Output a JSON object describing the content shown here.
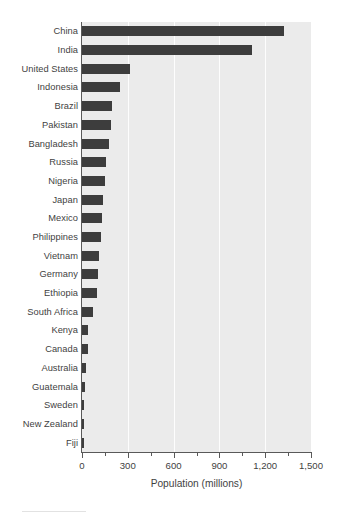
{
  "chart_data": {
    "type": "bar",
    "orientation": "horizontal",
    "title": "",
    "xlabel": "Population (millions)",
    "ylabel": "",
    "xlim": [
      0,
      1500
    ],
    "xticks": [
      0,
      300,
      600,
      900,
      1200,
      1500
    ],
    "xtick_labels": [
      "0",
      "300",
      "600",
      "900",
      "1,200",
      "1,500"
    ],
    "minor_xticks": [
      150,
      450,
      750,
      1050,
      1350
    ],
    "grid": "vertical-white-major",
    "legend": "none",
    "bar_color": "#3d3d3d",
    "panel_color": "#ebebeb",
    "gridline_color": "#fdfdfd",
    "categories": [
      "China",
      "India",
      "United States",
      "Indonesia",
      "Brazil",
      "Pakistan",
      "Bangladesh",
      "Russia",
      "Nigeria",
      "Japan",
      "Mexico",
      "Philippines",
      "Vietnam",
      "Germany",
      "Ethiopia",
      "South Africa",
      "Kenya",
      "Canada",
      "Australia",
      "Guatemala",
      "Sweden",
      "New Zealand",
      "Fiji"
    ],
    "values": [
      1324,
      1115,
      313,
      248,
      196,
      190,
      176,
      157,
      150,
      137,
      130,
      124,
      111,
      105,
      98,
      72,
      39,
      38,
      26,
      18,
      11,
      5,
      2
    ]
  },
  "xaxis": {
    "title": "Population (millions)"
  }
}
